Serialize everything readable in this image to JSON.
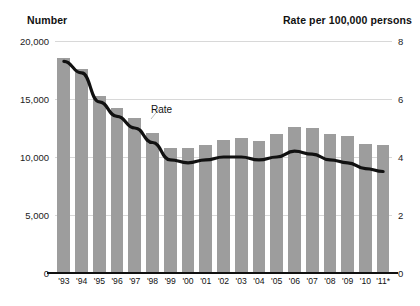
{
  "axis_titles": {
    "left": "Number",
    "right": "Rate per 100,000 persons"
  },
  "annotation": {
    "rate_label": "Rate"
  },
  "colors": {
    "bar": "#9d9d9d",
    "line": "#111111",
    "grid": "#d8d8d8",
    "text": "#111111"
  },
  "chart_data": {
    "type": "bar",
    "title": "",
    "subtitle": "",
    "xlabel": "",
    "ylabel": "Number",
    "y2label": "Rate per 100,000 persons",
    "grid": true,
    "legend": "none",
    "categories": [
      "'93",
      "'94",
      "'95",
      "'96",
      "'97",
      "'98",
      "'99",
      "'00",
      "'01",
      "'02",
      "'03",
      "'04",
      "'05",
      "'06",
      "'07",
      "'08",
      "'09",
      "'10",
      "'11*"
    ],
    "ylim": [
      0,
      20000
    ],
    "yticks": [
      0,
      5000,
      10000,
      15000,
      20000
    ],
    "ytick_labels": [
      "0",
      "5,000",
      "10,000",
      "15,000",
      "20,000"
    ],
    "y2lim": [
      0,
      8
    ],
    "y2ticks": [
      0,
      2,
      4,
      6,
      8
    ],
    "y2tick_labels": [
      "0",
      "2",
      "4",
      "6",
      "8"
    ],
    "series": [
      {
        "name": "Number",
        "type": "bar",
        "axis": "left",
        "values": [
          18500,
          17600,
          15300,
          14200,
          13400,
          12100,
          10800,
          10800,
          11000,
          11500,
          11600,
          11400,
          12000,
          12600,
          12500,
          12000,
          11800,
          11100,
          11000
        ]
      },
      {
        "name": "Rate",
        "type": "line",
        "axis": "right",
        "values": [
          7.3,
          6.9,
          5.9,
          5.4,
          5.0,
          4.5,
          3.9,
          3.8,
          3.9,
          4.0,
          4.0,
          3.9,
          4.0,
          4.2,
          4.1,
          3.9,
          3.8,
          3.6,
          3.5
        ]
      }
    ],
    "annotations": [
      {
        "text": "Rate",
        "x": "'97",
        "y2": 5.2
      }
    ]
  }
}
